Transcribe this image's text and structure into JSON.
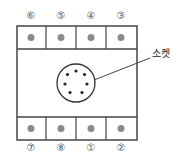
{
  "diagram": {
    "socket_label": "소켓",
    "top_pins": [
      "⑥",
      "⑤",
      "④",
      "③"
    ],
    "bottom_pins": [
      "⑦",
      "⑧",
      "①",
      "②"
    ],
    "colors": {
      "line": "#444444",
      "pin_dot": "#8a8a8a",
      "socket_dot": "#222222"
    }
  }
}
